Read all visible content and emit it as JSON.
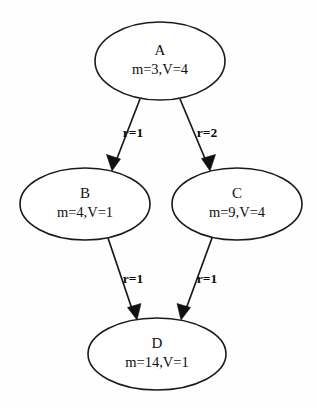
{
  "diagram": {
    "type": "directed-graph",
    "background_color": "#fefefe",
    "stroke_color": "#1a1a1a",
    "text_color": "#111111",
    "nodes": [
      {
        "id": "A",
        "label": "A",
        "attributes": "m=3,V=4",
        "m": 3,
        "V": 4,
        "cx": 160,
        "cy": 61,
        "rx": 65,
        "ry": 39
      },
      {
        "id": "B",
        "label": "B",
        "attributes": "m=4,V=1",
        "m": 4,
        "V": 1,
        "cx": 85,
        "cy": 204,
        "rx": 65,
        "ry": 36
      },
      {
        "id": "C",
        "label": "C",
        "attributes": "m=9,V=4",
        "m": 9,
        "V": 4,
        "cx": 237,
        "cy": 204,
        "rx": 65,
        "ry": 36
      },
      {
        "id": "D",
        "label": "D",
        "attributes": "m=14,V=1",
        "m": 14,
        "V": 1,
        "cx": 157,
        "cy": 354,
        "rx": 69,
        "ry": 36
      }
    ],
    "edges": [
      {
        "from": "A",
        "to": "B",
        "label": "r=1",
        "r": 1,
        "x1": 140,
        "y1": 99,
        "x2": 112,
        "y2": 170,
        "label_x": 133,
        "label_y": 137
      },
      {
        "from": "A",
        "to": "C",
        "label": "r=2",
        "r": 2,
        "x1": 180,
        "y1": 99,
        "x2": 210,
        "y2": 170,
        "label_x": 207,
        "label_y": 137
      },
      {
        "from": "B",
        "to": "D",
        "label": "r=1",
        "r": 1,
        "x1": 108,
        "y1": 238,
        "x2": 137,
        "y2": 319,
        "label_x": 133,
        "label_y": 283
      },
      {
        "from": "C",
        "to": "D",
        "label": "r=1",
        "r": 1,
        "x1": 212,
        "y1": 238,
        "x2": 181,
        "y2": 319,
        "label_x": 207,
        "label_y": 283
      }
    ]
  }
}
